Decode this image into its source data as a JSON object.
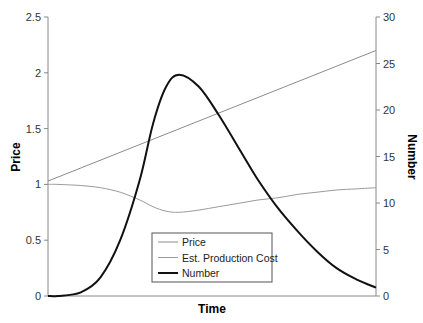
{
  "chart_data": {
    "type": "line",
    "title": "",
    "xlabel": "Time",
    "ylabel": "Price",
    "y2label": "Number",
    "ylim": [
      0,
      2.5
    ],
    "y2lim": [
      0,
      30
    ],
    "xlim": [
      0,
      100
    ],
    "yticks": [
      "0",
      "0.5",
      "1",
      "1.5",
      "2",
      "2.5"
    ],
    "y2ticks": [
      "0",
      "5",
      "10",
      "15",
      "20",
      "25",
      "30"
    ],
    "grid": false,
    "legend_position": "inside-bottom-center",
    "x": [
      0,
      3,
      10,
      16,
      22,
      28,
      32,
      36,
      40,
      46,
      52,
      58,
      64,
      70,
      76,
      82,
      88,
      94,
      100
    ],
    "series": [
      {
        "name": "Price",
        "axis": "left",
        "color": "#8c8c8c",
        "width": 1,
        "values": [
          1.03,
          1.06,
          1.13,
          1.19,
          1.26,
          1.32,
          1.36,
          1.4,
          1.44,
          1.51,
          1.57,
          1.63,
          1.7,
          1.76,
          1.82,
          1.89,
          1.95,
          2.01,
          2.2
        ]
      },
      {
        "name": "Est. Production Cost",
        "axis": "left",
        "color": "#9a9a9a",
        "width": 1,
        "values": [
          1.0,
          1.0,
          0.99,
          0.97,
          0.93,
          0.86,
          0.8,
          0.76,
          0.75,
          0.77,
          0.8,
          0.83,
          0.86,
          0.88,
          0.91,
          0.93,
          0.95,
          0.96,
          0.97
        ]
      },
      {
        "name": "Number",
        "axis": "right",
        "color": "#111111",
        "width": 2,
        "values": [
          0,
          0,
          0.4,
          2,
          6,
          12.5,
          18.5,
          22.5,
          23.8,
          22.5,
          19.5,
          16,
          12.5,
          9.5,
          7,
          4.8,
          3,
          1.8,
          0.9
        ]
      }
    ]
  },
  "legend": {
    "items": [
      {
        "label": "Price",
        "color": "#8c8c8c",
        "width": 1
      },
      {
        "label": "Est. Production Cost",
        "color": "#9a9a9a",
        "width": 1
      },
      {
        "label": "Number",
        "color": "#111111",
        "width": 2
      }
    ]
  },
  "labels": {
    "x_title": "Time",
    "y_left_title": "Price",
    "y_right_title": "Number"
  }
}
